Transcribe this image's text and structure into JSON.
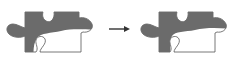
{
  "diagram": {
    "colors": {
      "fill_shaded": "#6b6b6b",
      "fill_unshaded": "#ffffff",
      "outline": "#555555",
      "arrow": "#333333"
    },
    "panels": [
      {
        "id": "before",
        "label": "",
        "shading": "partial"
      },
      {
        "id": "after",
        "label": "",
        "shading": "partial-more"
      }
    ],
    "arrow": {
      "direction": "right"
    }
  }
}
